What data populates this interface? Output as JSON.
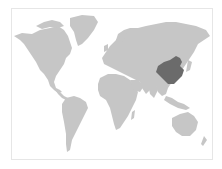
{
  "map": {
    "type": "world-locator-map",
    "highlighted_region": "China",
    "colors": {
      "land": "#c6c6c6",
      "highlight": "#6b6b6b",
      "water": "#ffffff",
      "frame": "#e6e6e6"
    }
  }
}
